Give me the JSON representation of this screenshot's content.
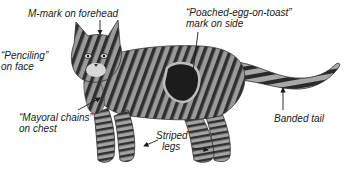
{
  "annotations": {
    "m_mark": {
      "line1": "M-mark on forehead"
    },
    "penciling": {
      "line1": "“Penciling”",
      "line2": "on face"
    },
    "poached_egg": {
      "line1": "“Poached-egg-on-toast”",
      "line2": "mark on side"
    },
    "mayoral_chains": {
      "line1": "“Mayoral chains”",
      "line2": "on chest"
    },
    "striped_legs": {
      "line1": "Striped",
      "line2": "legs"
    },
    "banded_tail": {
      "line1": "Banded tail"
    }
  },
  "colors": {
    "background": "#ffffff",
    "text": "#1a1a1a",
    "fur_light": "#a9a9a9",
    "fur_dark": "#2b2b2b",
    "arrow": "#1a1a1a"
  }
}
